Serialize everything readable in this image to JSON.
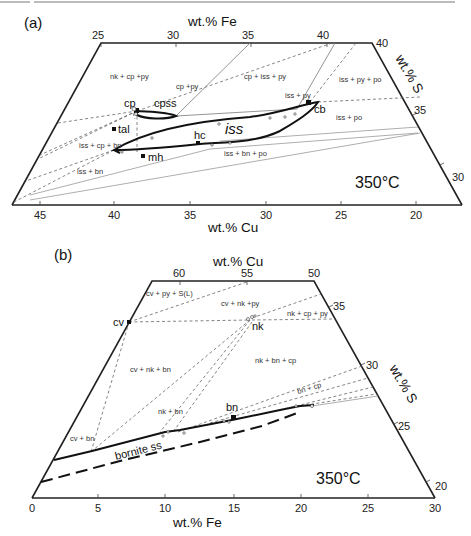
{
  "figure": {
    "panels": [
      {
        "id": "a",
        "label": "(a)",
        "temperature": "350°C",
        "top_axis": {
          "title": "wt.% Fe",
          "ticks": [
            "25",
            "30",
            "35",
            "40"
          ]
        },
        "bottom_axis": {
          "title": "wt.% Cu",
          "ticks": [
            "45",
            "40",
            "35",
            "30",
            "25",
            "20"
          ]
        },
        "right_axis": {
          "title": "wt.% S",
          "ticks": [
            "40",
            "35",
            "30"
          ]
        },
        "phases": [
          "cp",
          "cpss",
          "tal",
          "hc",
          "mh",
          "cb",
          "iss"
        ],
        "fields": [
          "nk + cp +py",
          "cp +py",
          "cp + iss + py",
          "iss + py + po",
          "iss + py",
          "iss + po",
          "iss + cp + bn",
          "iss + bn",
          "iss + bn + po"
        ]
      },
      {
        "id": "b",
        "label": "(b)",
        "temperature": "350°C",
        "top_axis": {
          "title": "wt.% Cu",
          "ticks": [
            "60",
            "55",
            "50"
          ]
        },
        "bottom_axis": {
          "title": "wt.% Fe",
          "ticks": [
            "0",
            "5",
            "10",
            "15",
            "20",
            "25",
            "30"
          ]
        },
        "right_axis": {
          "title": "wt.% S",
          "ticks": [
            "35",
            "30",
            "25",
            "20"
          ]
        },
        "phases": [
          "cv",
          "nk",
          "bn",
          "bornite ss"
        ],
        "fields": [
          "cv + py + S(L)",
          "cv + nk +py",
          "nk + cp + py",
          "nk + bn + cp",
          "cv + nk + bn",
          "nk + bn",
          "cv + bn",
          "bn + cp"
        ]
      }
    ]
  },
  "a": {
    "label": "(a)",
    "temp": "350°C",
    "fe_title": "wt.% Fe",
    "cu_title": "wt.% Cu",
    "s_title": "wt.% S",
    "fe_ticks": [
      "25",
      "30",
      "35",
      "40"
    ],
    "cu_ticks": [
      "45",
      "40",
      "35",
      "30",
      "25",
      "20"
    ],
    "s_ticks": [
      "40",
      "35",
      "30"
    ],
    "phase": {
      "cp": "cp",
      "cpss": "cpss",
      "tal": "tal",
      "hc": "hc",
      "mh": "mh",
      "cb": "cb",
      "iss": "iss"
    },
    "field": {
      "nk_cp_py": "nk + cp +py",
      "cp_py": "cp +py",
      "cp_iss_py": "cp + iss + py",
      "iss_py_po": "iss + py + po",
      "iss_py": "iss + py",
      "iss_po": "iss + po",
      "iss_cp_bn": "iss + cp + bn",
      "iss_bn": "iss + bn",
      "iss_bn_po": "iss + bn + po"
    }
  },
  "b": {
    "label": "(b)",
    "temp": "350°C",
    "cu_title": "wt.% Cu",
    "fe_title": "wt.% Fe",
    "s_title": "wt.% S",
    "cu_ticks": [
      "60",
      "55",
      "50"
    ],
    "fe_ticks": [
      "0",
      "5",
      "10",
      "15",
      "20",
      "25",
      "30"
    ],
    "s_ticks": [
      "35",
      "30",
      "25",
      "20"
    ],
    "phase": {
      "cv": "cv",
      "nk": "nk",
      "bn": "bn",
      "bornite_ss": "bornite ss"
    },
    "field": {
      "cv_py_sl": "cv + py + S(L)",
      "cv_nk_py": "cv + nk +py",
      "nk_cp_py": "nk + cp + py",
      "nk_bn_cp": "nk + bn + cp",
      "cv_nk_bn": "cv + nk + bn",
      "nk_bn": "nk + bn",
      "cv_bn": "cv + bn",
      "bn_cp": "bn + cp"
    }
  }
}
